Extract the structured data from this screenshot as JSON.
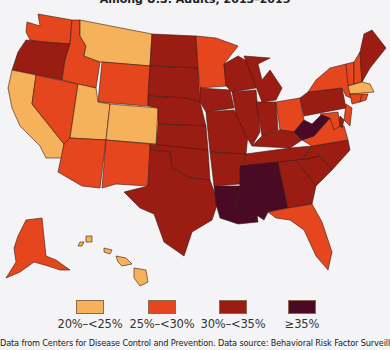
{
  "title": "Among U.S. Adults, 2013–2015",
  "colors": {
    "c1": "#f5b25a",
    "c2": "#e5461e",
    "c3": "#9b1c12",
    "c4": "#4a0a26",
    "background": "#f4f4f6"
  },
  "legend": [
    {
      "label": "20%–<25%",
      "color": "#f5b25a"
    },
    {
      "label": "25%–<30%",
      "color": "#e5461e"
    },
    {
      "label": "30%–<35%",
      "color": "#9b1c12"
    },
    {
      "label": "≥35%",
      "color": "#4a0a26"
    }
  ],
  "source": "Data from Centers for Disease Control and Prevention. Data source: Behavioral Risk Factor Surveillance System.",
  "states": {
    "WA": "25–<30",
    "OR": "30–<35",
    "CA": "20–<25",
    "NV": "25–<30",
    "ID": "25–<30",
    "MT": "20–<25",
    "WY": "25–<30",
    "UT": "20–<25",
    "CO": "20–<25",
    "AZ": "25–<30",
    "NM": "25–<30",
    "ND": "30–<35",
    "SD": "30–<35",
    "NE": "30–<35",
    "KS": "30–<35",
    "OK": "30–<35",
    "TX": "30–<35",
    "MN": "25–<30",
    "IA": "30–<35",
    "MO": "30–<35",
    "AR": "30–<35",
    "LA": "≥35",
    "WI": "30–<35",
    "IL": "30–<35",
    "MI": "30–<35",
    "IN": "30–<35",
    "OH": "25–<30",
    "KY": "30–<35",
    "TN": "30–<35",
    "MS": "≥35",
    "AL": "≥35",
    "GA": "30–<35",
    "FL": "25–<30",
    "SC": "30–<35",
    "NC": "30–<35",
    "VA": "25–<30",
    "WV": "≥35",
    "PA": "30–<35",
    "NY": "25–<30",
    "VT": "25–<30",
    "NH": "25–<30",
    "ME": "30–<35",
    "MA": "20–<25",
    "CT": "25–<30",
    "RI": "25–<30",
    "NJ": "25–<30",
    "DE": "30–<35",
    "MD": "25–<30",
    "AK": "25–<30",
    "HI": "20–<25"
  }
}
